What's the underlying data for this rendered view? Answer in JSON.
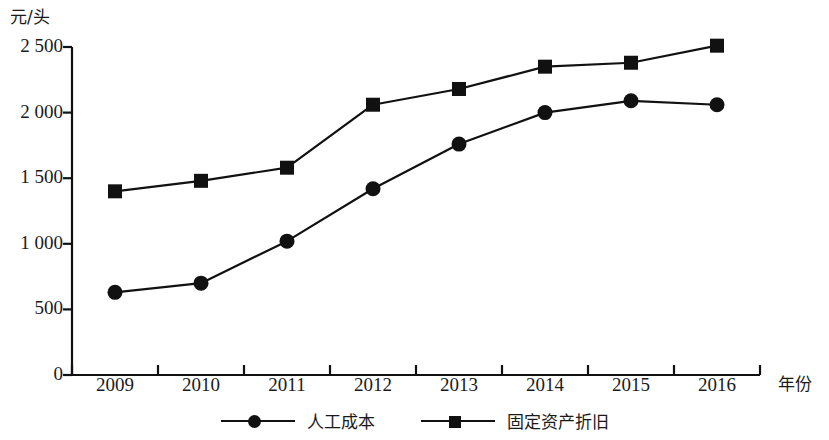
{
  "chart_data": {
    "type": "line",
    "title": "",
    "xlabel": "年份",
    "ylabel": "元/头",
    "categories": [
      "2009",
      "2010",
      "2011",
      "2012",
      "2013",
      "2014",
      "2015",
      "2016"
    ],
    "ylim": [
      0,
      2500
    ],
    "yticks": [
      0,
      500,
      1000,
      1500,
      2000,
      2500
    ],
    "ytick_labels": [
      "0",
      "500",
      "1 000",
      "1 500",
      "2 000",
      "2 500"
    ],
    "grid": false,
    "legend_position": "bottom",
    "series": [
      {
        "name": "人工成本",
        "marker": "circle",
        "color": "#111111",
        "values": [
          630,
          700,
          1020,
          1420,
          1760,
          2000,
          2090,
          2060
        ]
      },
      {
        "name": "固定资产折旧",
        "marker": "square",
        "color": "#111111",
        "values": [
          1400,
          1480,
          1580,
          2060,
          2180,
          2350,
          2380,
          2510
        ]
      }
    ]
  },
  "axis": {
    "y_unit_label": "元/头",
    "x_unit_label": "年份"
  },
  "colors": {
    "ink": "#111111",
    "background": "#ffffff"
  }
}
